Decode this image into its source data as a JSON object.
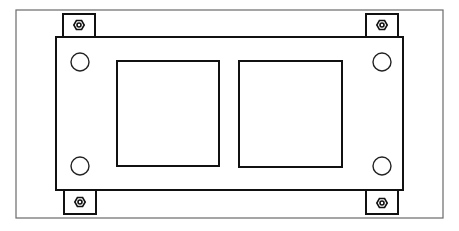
{
  "diagram": {
    "type": "technical-line-drawing",
    "colors": {
      "background": "#ffffff",
      "stroke": "#111111",
      "frame": "#6a6a6a"
    },
    "frame": {
      "x": 16,
      "y": 10,
      "w": 427,
      "h": 208
    },
    "plate": {
      "x": 56,
      "y": 37,
      "w": 347,
      "h": 153
    },
    "openings": [
      {
        "name": "left-opening",
        "x": 117,
        "y": 61,
        "w": 102,
        "h": 105
      },
      {
        "name": "right-opening",
        "x": 239,
        "y": 61,
        "w": 103,
        "h": 106
      }
    ],
    "holes": [
      {
        "name": "top-left",
        "cx": 80,
        "cy": 62,
        "r": 9
      },
      {
        "name": "top-right",
        "cx": 382,
        "cy": 62,
        "r": 9
      },
      {
        "name": "bottom-left",
        "cx": 80,
        "cy": 166,
        "r": 9
      },
      {
        "name": "bottom-right",
        "cx": 382,
        "cy": 166,
        "r": 9
      }
    ],
    "tabs": [
      {
        "name": "top-left",
        "x": 63,
        "y": 14,
        "w": 32,
        "h": 23,
        "nut_cx": 79,
        "nut_cy": 25
      },
      {
        "name": "top-right",
        "x": 366,
        "y": 14,
        "w": 32,
        "h": 23,
        "nut_cx": 382,
        "nut_cy": 25
      },
      {
        "name": "bottom-left",
        "x": 64,
        "y": 190,
        "w": 32,
        "h": 24,
        "nut_cx": 80,
        "nut_cy": 202
      },
      {
        "name": "bottom-right",
        "x": 366,
        "y": 190,
        "w": 32,
        "h": 24,
        "nut_cx": 382,
        "nut_cy": 203
      }
    ]
  }
}
